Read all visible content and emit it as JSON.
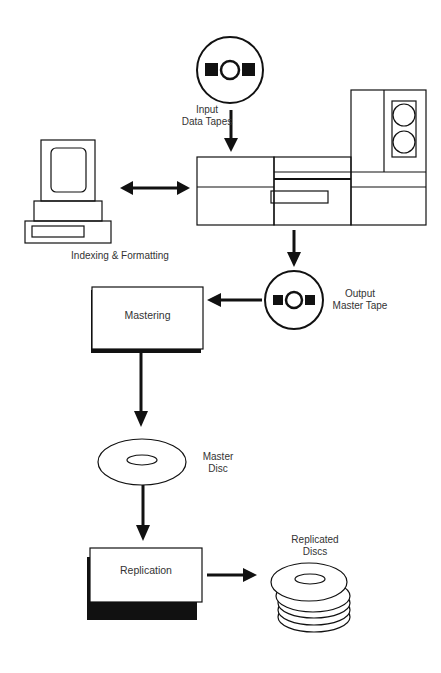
{
  "diagram": {
    "nodes": {
      "input_tapes": {
        "line1": "Input",
        "line2": "Data Tapes"
      },
      "indexing": {
        "label": "Indexing & Formatting"
      },
      "output_tape": {
        "line1": "Output",
        "line2": "Master Tape"
      },
      "mastering": {
        "label": "Mastering"
      },
      "master_disc": {
        "line1": "Master",
        "line2": "Disc"
      },
      "replication": {
        "label": "Replication"
      },
      "replicated_discs": {
        "line1": "Replicated",
        "line2": "Discs"
      }
    },
    "edges": [
      {
        "from": "input_tapes",
        "to": "tape_drive_system",
        "type": "arrow"
      },
      {
        "from": "computer_terminal",
        "to": "tape_drive_system",
        "type": "bidirectional"
      },
      {
        "from": "tape_drive_system",
        "to": "output_tape",
        "type": "arrow"
      },
      {
        "from": "output_tape",
        "to": "mastering",
        "type": "arrow"
      },
      {
        "from": "mastering",
        "to": "master_disc",
        "type": "arrow"
      },
      {
        "from": "master_disc",
        "to": "replication",
        "type": "arrow"
      },
      {
        "from": "replication",
        "to": "replicated_discs",
        "type": "arrow"
      }
    ],
    "colors": {
      "stroke": "#111111",
      "background": "#ffffff",
      "text": "#333333"
    }
  }
}
